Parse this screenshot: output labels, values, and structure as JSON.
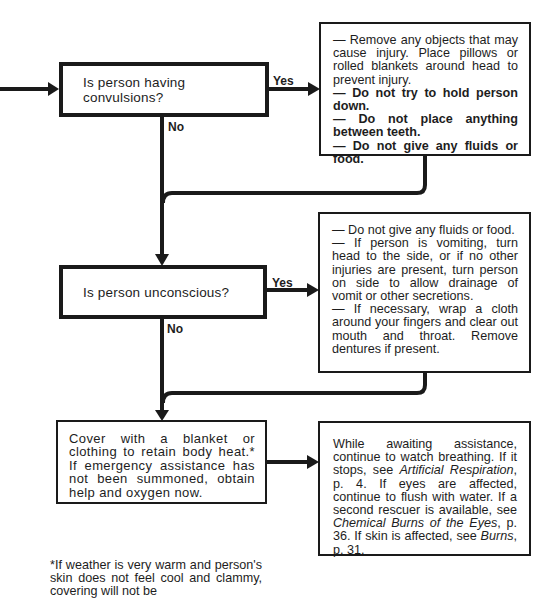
{
  "flowchart": {
    "questions": [
      {
        "text": "Is person having convulsions?",
        "yes_label": "Yes",
        "no_label": "No",
        "yes_actions": [
          {
            "text": "— Remove any objects that may cause injury. Place pillows or rolled blankets around head to prevent injury.",
            "bold": false
          },
          {
            "text": "— Do not try to hold person down.",
            "bold": true
          },
          {
            "text": "— Do not place anything between teeth.",
            "bold": true
          },
          {
            "text": "— Do not give any fluids or food.",
            "bold": true
          }
        ]
      },
      {
        "text": "Is person unconscious?",
        "yes_label": "Yes",
        "no_label": "No",
        "yes_actions": [
          {
            "text": "— Do not give any fluids or food.",
            "bold": false
          },
          {
            "text": "— If person is vomiting, turn head to the side, or if no other injuries are present, turn person on side to allow drainage of vomit or other secretions.",
            "bold": false
          },
          {
            "text": "— If necessary, wrap a cloth around your fingers and clear out mouth and throat. Remove dentures if present.",
            "bold": false
          }
        ]
      }
    ],
    "final_step": {
      "text": "Cover with a blanket or clothing to retain body heat.* If emergency assistance has not been summoned, obtain help and oxygen now."
    },
    "followup": {
      "parts": [
        {
          "text": "While awaiting assistance, continue to watch breathing. If it stops, see ",
          "italic": false
        },
        {
          "text": "Artificial Respiration",
          "italic": true
        },
        {
          "text": ", p. 4. If eyes are affected, continue to flush with water. If a second rescuer is available, see ",
          "italic": false
        },
        {
          "text": "Chemical Burns of the Eyes",
          "italic": true
        },
        {
          "text": ", p. 36. If skin is affected, see ",
          "italic": false
        },
        {
          "text": "Burns",
          "italic": true
        },
        {
          "text": ", p. 31.",
          "italic": false
        }
      ]
    },
    "footnote": "*If weather is very warm and person's skin does not feel cool and clammy, covering will not be"
  },
  "colors": {
    "line": "#1a1a1a",
    "background": "#ffffff",
    "text": "#1d1d1d"
  }
}
